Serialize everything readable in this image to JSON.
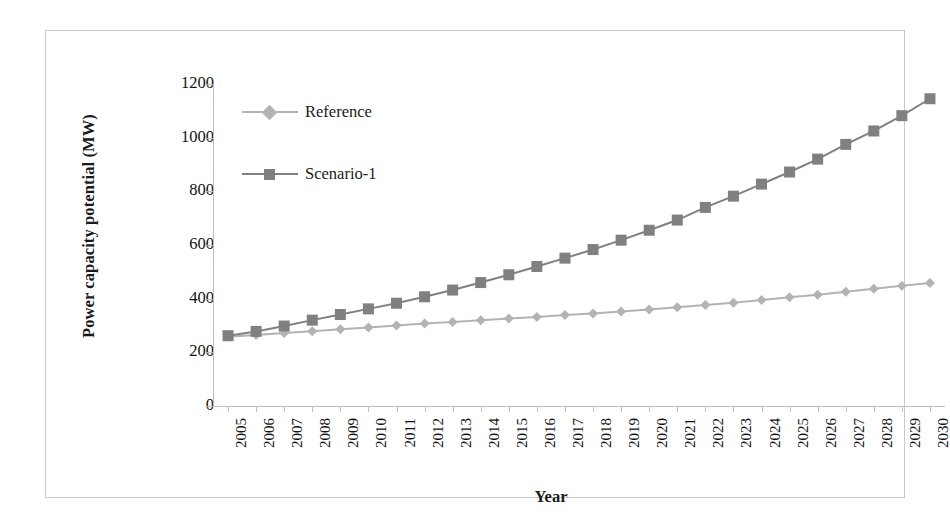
{
  "chart_data": {
    "type": "line",
    "title": "",
    "xlabel": "Year",
    "ylabel": "Power capacity potential (MW)",
    "x": [
      2005,
      2006,
      2007,
      2008,
      2009,
      2010,
      2011,
      2012,
      2013,
      2014,
      2015,
      2016,
      2017,
      2018,
      2019,
      2020,
      2021,
      2022,
      2023,
      2024,
      2025,
      2026,
      2027,
      2028,
      2029,
      2030
    ],
    "categories": [
      "2005",
      "2006",
      "2007",
      "2008",
      "2009",
      "2010",
      "2011",
      "2012",
      "2013",
      "2014",
      "2015",
      "2016",
      "2017",
      "2018",
      "2019",
      "2020",
      "2021",
      "2022",
      "2023",
      "2024",
      "2025",
      "2026",
      "2027",
      "2028",
      "2029",
      "2030"
    ],
    "series": [
      {
        "name": "Reference",
        "color": "#b3b3b3",
        "marker": "diamond",
        "values": [
          258,
          265,
          272,
          279,
          286,
          293,
          300,
          307,
          313,
          320,
          326,
          332,
          339,
          345,
          352,
          360,
          368,
          376,
          385,
          395,
          405,
          415,
          426,
          437,
          448,
          458
        ]
      },
      {
        "name": "Scenario-1",
        "color": "#808080",
        "marker": "square",
        "values": [
          262,
          278,
          298,
          320,
          341,
          362,
          383,
          407,
          432,
          460,
          489,
          520,
          551,
          583,
          618,
          655,
          693,
          740,
          782,
          827,
          872,
          920,
          975,
          1025,
          1082,
          1145
        ]
      }
    ],
    "ylim": [
      0,
      1200
    ],
    "y_ticks": [
      0,
      200,
      400,
      600,
      800,
      1000,
      1200
    ],
    "y_tick_labels": [
      "0",
      "200",
      "400",
      "600",
      "800",
      "1000",
      "1200"
    ],
    "grid": false,
    "legend_position": "upper-left-inside",
    "xlabel_rotation": -90
  },
  "legend": {
    "entries": [
      {
        "label": "Reference"
      },
      {
        "label": "Scenario-1"
      }
    ]
  },
  "axes": {
    "x_title": "Year",
    "y_title": "Power capacity potential (MW)"
  },
  "colors": {
    "reference": "#b3b3b3",
    "scenario1": "#808080",
    "axis": "#bdbdbd",
    "frame": "#c9c9c9",
    "text": "#1a1a1a",
    "background": "#ffffff"
  }
}
